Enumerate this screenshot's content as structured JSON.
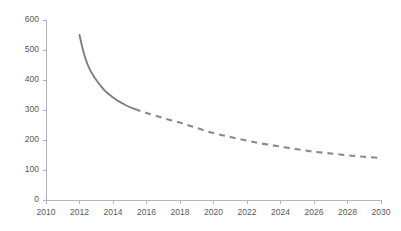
{
  "chart_data": {
    "type": "line",
    "title": "",
    "subtitle": "",
    "xlabel": "",
    "ylabel": "",
    "xlim": [
      2010,
      2030
    ],
    "ylim": [
      0,
      600
    ],
    "grid": false,
    "legend": null,
    "legend_position": "none",
    "xticks": [
      2010,
      2012,
      2014,
      2016,
      2018,
      2020,
      2022,
      2024,
      2026,
      2028,
      2030
    ],
    "xtick_labels": [
      "2010",
      "2012",
      "2014",
      "2016",
      "2018",
      "2020",
      "2022",
      "2024",
      "2026",
      "2028",
      "2030"
    ],
    "yticks": [
      0,
      100,
      200,
      300,
      400,
      500,
      600
    ],
    "ytick_labels": [
      "0",
      "100",
      "200",
      "300",
      "400",
      "500",
      "600"
    ],
    "series": [
      {
        "name": "historical",
        "style": "solid",
        "color": "#7f7f7f",
        "x": [
          2012.0,
          2012.2,
          2012.4,
          2012.6,
          2012.8,
          2013.0,
          2013.3,
          2013.6,
          2014.0,
          2014.4,
          2014.8,
          2015.3
        ],
        "values": [
          550,
          502,
          464,
          437,
          417,
          400,
          378,
          360,
          342,
          327,
          315,
          303
        ]
      },
      {
        "name": "projection",
        "style": "dashed",
        "color": "#8a8a8a",
        "x": [
          2015.3,
          2016,
          2017,
          2018,
          2019,
          2020,
          2021,
          2022,
          2023,
          2024,
          2025,
          2026,
          2027,
          2028,
          2029,
          2030
        ],
        "values": [
          303,
          290,
          273,
          258,
          240,
          223,
          210,
          198,
          187,
          178,
          169,
          161,
          155,
          149,
          144,
          140
        ]
      }
    ],
    "annotations": [],
    "axis_color": "#b4b4b4",
    "label_color": "#595959",
    "background": "#ffffff"
  },
  "geometry": {
    "plot_left": 46,
    "plot_right": 381,
    "plot_top": 20,
    "plot_bottom": 200
  }
}
